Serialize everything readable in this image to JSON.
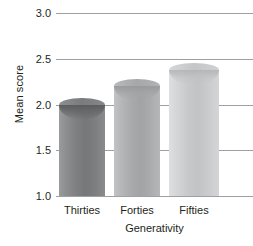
{
  "chart_data": {
    "type": "bar",
    "title": "",
    "xlabel": "Generativity",
    "ylabel": "Mean score",
    "categories": [
      "Thirties",
      "Forties",
      "Fifties"
    ],
    "values": [
      2.0,
      2.2,
      2.38
    ],
    "ylim": [
      1.0,
      3.0
    ],
    "yticks": [
      "1.0",
      "1.5",
      "2.0",
      "2.5",
      "3.0"
    ],
    "ytick_values": [
      1.0,
      1.5,
      2.0,
      2.5,
      3.0
    ],
    "grid": true,
    "legend": "none",
    "bar_style": "3d-cylinder",
    "bar_colors": [
      "#7e7f81",
      "#a9aaac",
      "#c8c9ca"
    ],
    "gridline_color": "#9d9fa2",
    "background_color": "#ffffff",
    "text_color": "#231f20"
  }
}
